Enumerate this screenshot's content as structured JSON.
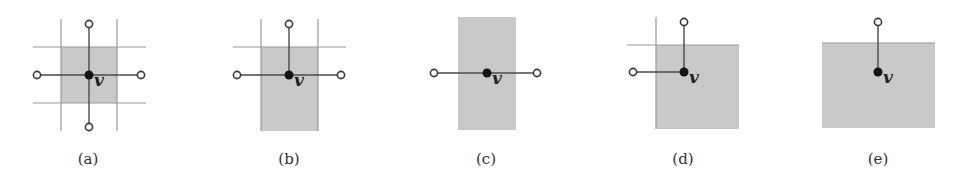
{
  "colors": {
    "region_fill": "#c9c9c9",
    "grid_line": "#9a9a9a",
    "edge_line": "#4a4a4a",
    "vertex_fill": "#151515",
    "neighbor_stroke": "#3a3a3a",
    "neighbor_fill": "#ffffff",
    "label": "#222222"
  },
  "vertex_label": "v",
  "panels": [
    {
      "id": "a",
      "caption": "(a)",
      "caption_x": 88,
      "center": [
        89,
        75
      ],
      "region": {
        "x": 61,
        "y": 47,
        "w": 56,
        "h": 56
      },
      "grid_lines": [
        {
          "x1": 61,
          "y1": 19,
          "x2": 61,
          "y2": 131
        },
        {
          "x1": 117,
          "y1": 19,
          "x2": 117,
          "y2": 131
        },
        {
          "x1": 33,
          "y1": 47,
          "x2": 146,
          "y2": 47
        },
        {
          "x1": 33,
          "y1": 103,
          "x2": 146,
          "y2": 103
        }
      ],
      "neighbors": [
        [
          89,
          24
        ],
        [
          89,
          127
        ],
        [
          37,
          75
        ],
        [
          141,
          75
        ]
      ]
    },
    {
      "id": "b",
      "caption": "(b)",
      "caption_x": 289,
      "center": [
        289,
        75
      ],
      "region": {
        "x": 261,
        "y": 47,
        "w": 57,
        "h": 84
      },
      "grid_lines": [
        {
          "x1": 261,
          "y1": 19,
          "x2": 261,
          "y2": 131
        },
        {
          "x1": 318,
          "y1": 19,
          "x2": 318,
          "y2": 131
        },
        {
          "x1": 233,
          "y1": 47,
          "x2": 346,
          "y2": 47
        }
      ],
      "neighbors": [
        [
          289,
          24
        ],
        [
          237,
          75
        ],
        [
          341,
          75
        ]
      ]
    },
    {
      "id": "c",
      "caption": "(c)",
      "caption_x": 486,
      "center": [
        487,
        73
      ],
      "region": {
        "x": 458,
        "y": 17,
        "w": 58,
        "h": 113
      },
      "grid_lines": [],
      "neighbors": [
        [
          434,
          73
        ],
        [
          537,
          73
        ]
      ]
    },
    {
      "id": "d",
      "caption": "(d)",
      "caption_x": 683,
      "center": [
        684,
        72
      ],
      "region": {
        "x": 656,
        "y": 45,
        "w": 83,
        "h": 84
      },
      "grid_lines": [
        {
          "x1": 656,
          "y1": 17,
          "x2": 656,
          "y2": 129
        },
        {
          "x1": 627,
          "y1": 45,
          "x2": 739,
          "y2": 45
        }
      ],
      "neighbors": [
        [
          684,
          22
        ],
        [
          633,
          72
        ]
      ]
    },
    {
      "id": "e",
      "caption": "(e)",
      "caption_x": 878,
      "center": [
        878,
        72
      ],
      "region": {
        "x": 822,
        "y": 43,
        "w": 113,
        "h": 85
      },
      "grid_lines": [
        {
          "x1": 822,
          "y1": 43,
          "x2": 935,
          "y2": 43
        }
      ],
      "neighbors": [
        [
          878,
          22
        ]
      ]
    }
  ]
}
